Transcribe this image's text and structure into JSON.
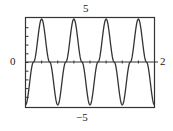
{
  "chart_data": {
    "type": "line",
    "title": "",
    "xlabel": "",
    "ylabel": "",
    "xlim": [
      0,
      2
    ],
    "ylim": [
      -5,
      5
    ],
    "grid": false,
    "legend": null,
    "window_labels": {
      "ymax": "5",
      "ymin": "−5",
      "xmin": "0",
      "xmax": "2"
    },
    "x_tick_count": 7,
    "y_tick_count": 9,
    "series": [
      {
        "name": "y(x)",
        "note": "approx. -5*cos(4*pi*x): starts at minimum, 4 full cycles",
        "color": "#333333",
        "x": [
          0,
          0.125,
          0.25,
          0.375,
          0.5,
          0.625,
          0.75,
          0.875,
          1.0,
          1.125,
          1.25,
          1.375,
          1.5,
          1.625,
          1.75,
          1.875,
          2.0
        ],
        "values": [
          -5,
          0,
          5,
          0,
          -5,
          0,
          5,
          0,
          -5,
          0,
          5,
          0,
          -5,
          0,
          5,
          0,
          -5
        ]
      }
    ]
  },
  "labels": {
    "ymax": "5",
    "ymin": "−5",
    "xmin": "0",
    "xmax": "2"
  }
}
